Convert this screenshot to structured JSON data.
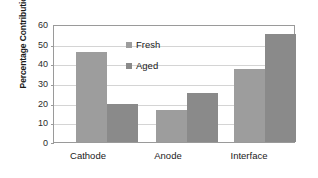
{
  "chart_data": {
    "type": "bar",
    "title": "",
    "xlabel": "",
    "ylabel": "Percentage Contribution",
    "categories": [
      "Cathode",
      "Anode",
      "Interface"
    ],
    "series": [
      {
        "name": "Fresh",
        "values": [
          46,
          16.5,
          37
        ],
        "color": "#9d9d9d"
      },
      {
        "name": "Aged",
        "values": [
          19.5,
          25,
          55
        ],
        "color": "#8a8a8a"
      }
    ],
    "ylim": [
      0,
      60
    ],
    "yticks": [
      0,
      10,
      20,
      30,
      40,
      50,
      60
    ],
    "ytick_labels": [
      "0",
      "10",
      "20",
      "30",
      "40",
      "50",
      "60"
    ],
    "grid": true,
    "grid_axis": "y",
    "legend_position": "inside-upper-center",
    "legend_entries": [
      "Fresh",
      "Aged"
    ],
    "frame": true,
    "background": "#ffffff"
  },
  "colors": {
    "fresh": "#9d9d9d",
    "aged": "#8a8a8a",
    "grid": "#d4d4d4",
    "frame": "#9a9a9a",
    "text": "#1a1a1a"
  }
}
